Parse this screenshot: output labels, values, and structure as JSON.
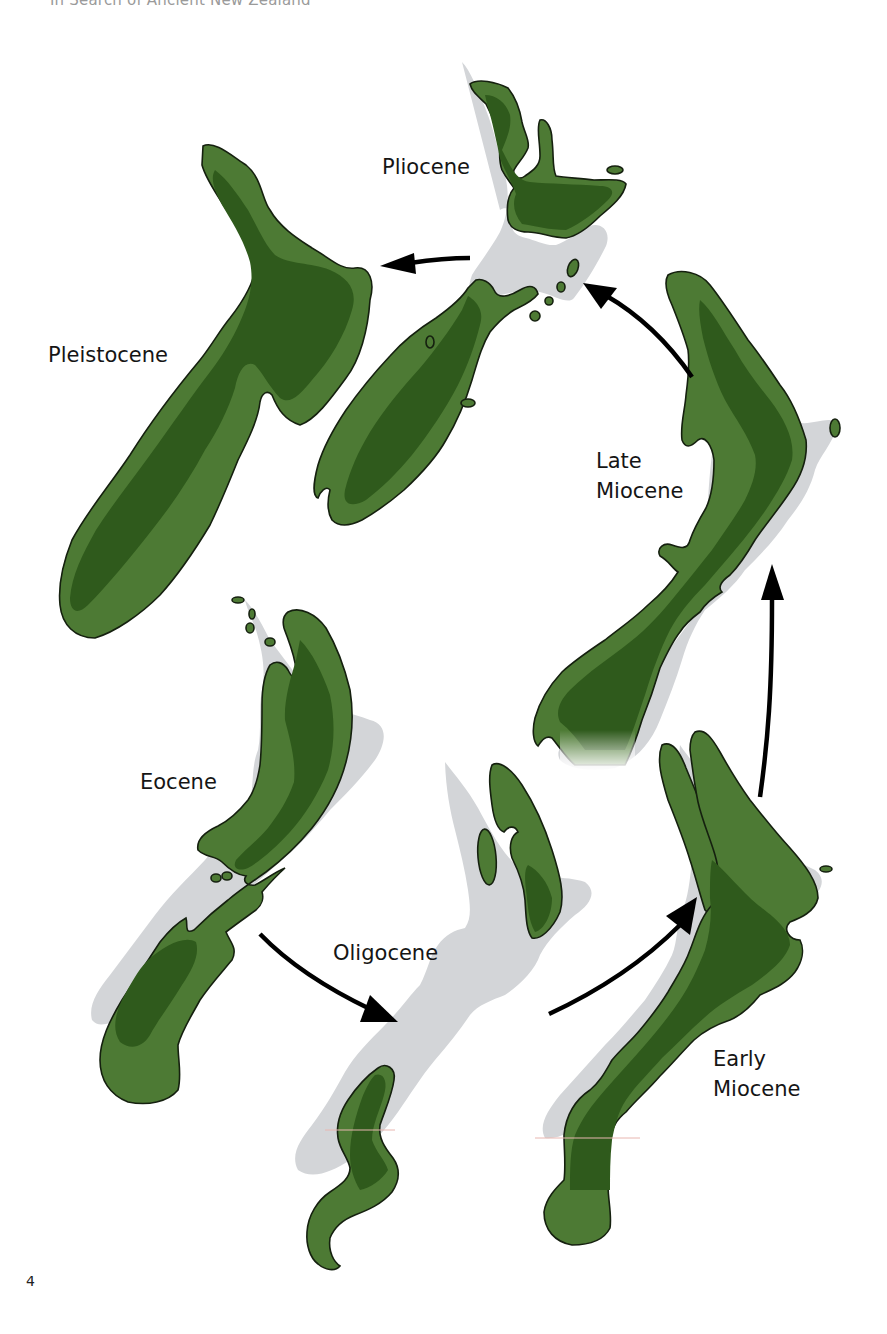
{
  "page": {
    "running_head": "In Search of Ancient New Zealand",
    "page_number": "4"
  },
  "colors": {
    "ancient_land": "#4d7a34",
    "ancient_land_core": "#2f5a1c",
    "coastline_outline": "#15200f",
    "modern_land": "#d3d5d8",
    "arrow": "#000000",
    "background": "#ffffff"
  },
  "diagram": {
    "sequence_direction": "clockwise from Eocene",
    "epochs": [
      {
        "id": "eocene",
        "label": "Eocene",
        "lines": [
          "Eocene"
        ]
      },
      {
        "id": "oligocene",
        "label": "Oligocene",
        "lines": [
          "Oligocene"
        ]
      },
      {
        "id": "early-miocene",
        "label": "Early Miocene",
        "lines": [
          "Early",
          "Miocene"
        ]
      },
      {
        "id": "late-miocene",
        "label": "Late Miocene",
        "lines": [
          "Late",
          "Miocene"
        ]
      },
      {
        "id": "pliocene",
        "label": "Pliocene",
        "lines": [
          "Pliocene"
        ]
      },
      {
        "id": "pleistocene",
        "label": "Pleistocene",
        "lines": [
          "Pleistocene"
        ]
      }
    ],
    "arrows": [
      {
        "from": "Eocene",
        "to": "Oligocene"
      },
      {
        "from": "Oligocene",
        "to": "Early Miocene"
      },
      {
        "from": "Early Miocene",
        "to": "Late Miocene"
      },
      {
        "from": "Late Miocene",
        "to": "Pliocene"
      },
      {
        "from": "Pliocene",
        "to": "Pleistocene"
      }
    ],
    "legend_implied": {
      "green": "ancient land area",
      "dark_green": "higher / core land",
      "grey": "modern New Zealand outline"
    }
  }
}
